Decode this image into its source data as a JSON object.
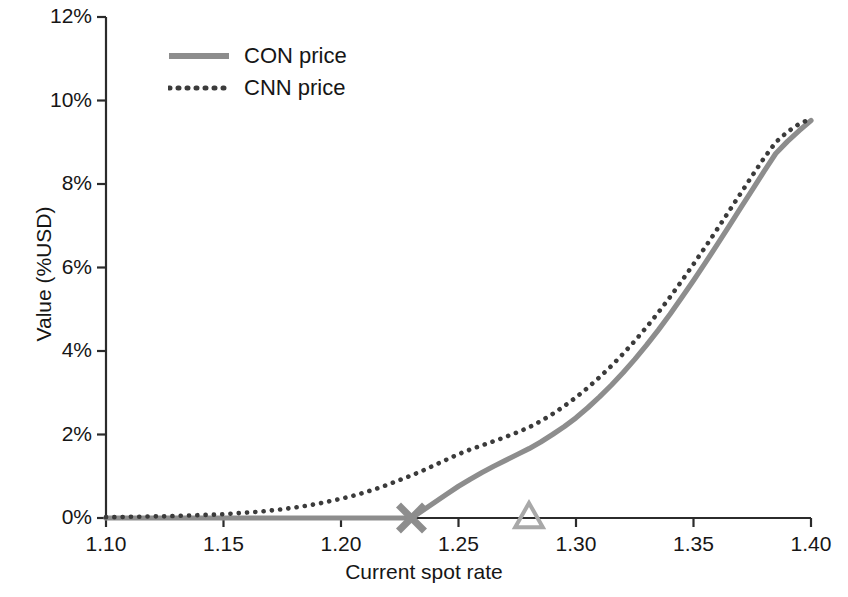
{
  "chart_data": {
    "type": "line",
    "title": "",
    "xlabel": "Current spot rate",
    "ylabel": "Value (%USD)",
    "xlim": [
      1.1,
      1.4
    ],
    "ylim": [
      0,
      12
    ],
    "grid": false,
    "legend_position": "top-left",
    "x_ticks": [
      "1.10",
      "1.15",
      "1.20",
      "1.25",
      "1.30",
      "1.35",
      "1.40"
    ],
    "x_tick_values": [
      1.1,
      1.15,
      1.2,
      1.25,
      1.3,
      1.35,
      1.4
    ],
    "y_ticks": [
      "0%",
      "2%",
      "4%",
      "6%",
      "8%",
      "10%",
      "12%"
    ],
    "y_tick_values": [
      0,
      2,
      4,
      6,
      8,
      10,
      12
    ],
    "x": [
      1.1,
      1.105,
      1.11,
      1.115,
      1.12,
      1.125,
      1.13,
      1.135,
      1.14,
      1.145,
      1.15,
      1.155,
      1.16,
      1.165,
      1.17,
      1.175,
      1.18,
      1.185,
      1.19,
      1.195,
      1.2,
      1.205,
      1.21,
      1.215,
      1.22,
      1.225,
      1.23,
      1.235,
      1.24,
      1.245,
      1.25,
      1.255,
      1.26,
      1.265,
      1.27,
      1.275,
      1.28,
      1.285,
      1.29,
      1.295,
      1.3,
      1.305,
      1.31,
      1.315,
      1.32,
      1.325,
      1.33,
      1.335,
      1.34,
      1.345,
      1.35,
      1.355,
      1.36,
      1.365,
      1.37,
      1.375,
      1.38,
      1.385,
      1.39,
      1.395,
      1.4
    ],
    "series": [
      {
        "name": "CON price",
        "style": "solid",
        "color": "#8d8d8d",
        "values": [
          0.0,
          0.0,
          0.0,
          0.0,
          0.0,
          0.0,
          0.0,
          0.0,
          0.0,
          0.0,
          0.0,
          0.0,
          0.0,
          0.0,
          0.0,
          0.0,
          0.0,
          0.0,
          0.0,
          0.0,
          0.0,
          0.0,
          0.0,
          0.0,
          0.0,
          0.0,
          0.0,
          0.19,
          0.38,
          0.57,
          0.76,
          0.93,
          1.09,
          1.24,
          1.38,
          1.52,
          1.66,
          1.82,
          2.0,
          2.19,
          2.4,
          2.64,
          2.9,
          3.18,
          3.48,
          3.8,
          4.14,
          4.5,
          4.88,
          5.28,
          5.69,
          6.11,
          6.54,
          6.98,
          7.42,
          7.86,
          8.3,
          8.73,
          9.02,
          9.28,
          9.52
        ]
      },
      {
        "name": "CNN price",
        "style": "dotted",
        "color": "#3b3b3b",
        "values": [
          0.02,
          0.02,
          0.03,
          0.03,
          0.04,
          0.04,
          0.05,
          0.06,
          0.07,
          0.08,
          0.09,
          0.11,
          0.13,
          0.15,
          0.18,
          0.21,
          0.25,
          0.29,
          0.34,
          0.4,
          0.46,
          0.53,
          0.61,
          0.7,
          0.8,
          0.91,
          1.02,
          1.14,
          1.27,
          1.4,
          1.53,
          1.64,
          1.74,
          1.84,
          1.94,
          2.05,
          2.17,
          2.32,
          2.49,
          2.68,
          2.89,
          3.12,
          3.37,
          3.64,
          3.93,
          4.24,
          4.57,
          4.92,
          5.29,
          5.68,
          6.08,
          6.49,
          6.91,
          7.34,
          7.77,
          8.2,
          8.62,
          9.0,
          9.25,
          9.44,
          9.56
        ]
      }
    ],
    "markers": [
      {
        "name": "con-strike-marker",
        "shape": "cross",
        "x": 1.23,
        "y": 0,
        "color": "#8d8d8d"
      },
      {
        "name": "cnn-barrier-marker",
        "shape": "triangle-up",
        "x": 1.28,
        "y": 0,
        "color": "#a8a8a8",
        "filled": false
      }
    ]
  },
  "legend": {
    "items": [
      {
        "label": "CON price",
        "style": "solid",
        "color": "#8d8d8d"
      },
      {
        "label": "CNN price",
        "style": "dotted",
        "color": "#3b3b3b"
      }
    ]
  },
  "axes": {
    "x_title": "Current spot rate",
    "y_title": "Value (%USD)"
  }
}
